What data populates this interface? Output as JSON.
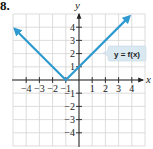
{
  "problem": {
    "number": "8."
  },
  "chart_data": {
    "type": "line",
    "title": "",
    "xlabel": "x",
    "ylabel": "y",
    "xlim": [
      -5,
      5
    ],
    "ylim": [
      -5,
      5
    ],
    "grid": true,
    "x_ticks": [
      -4,
      -3,
      -2,
      -1,
      1,
      2,
      3,
      4
    ],
    "y_ticks": [
      -4,
      -3,
      -2,
      -1,
      1,
      2,
      3,
      4
    ],
    "x_tick_labels": [
      "−4",
      "−3",
      "−2",
      "−1",
      "1",
      "2",
      "3",
      "4"
    ],
    "y_tick_labels": [
      "4",
      "3",
      "2",
      "1",
      "−1",
      "−2",
      "−3",
      "−4"
    ],
    "series": [
      {
        "name": "y = f(x)",
        "color": "#2f9ad0",
        "points": [
          [
            -4.85,
            3.85
          ],
          [
            -1,
            0
          ],
          [
            3.8,
            4.8
          ]
        ],
        "arrows": "both"
      }
    ],
    "annotations": [
      {
        "text": "y = f(x)",
        "x": 3.1,
        "y": 2.0,
        "style": "callout"
      }
    ]
  },
  "colors": {
    "grid": "#d4d4d4",
    "axis": "#222222",
    "line": "#2f9ad0",
    "callout_bg": "#d9e8f1"
  }
}
